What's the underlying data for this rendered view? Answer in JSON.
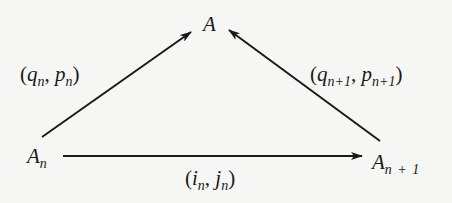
{
  "diagram": {
    "type": "commutative-triangle",
    "nodes": {
      "top": {
        "base": "A",
        "sub": ""
      },
      "left": {
        "base": "A",
        "sub": "n"
      },
      "right": {
        "base": "A",
        "sub": "n + 1"
      }
    },
    "edges": {
      "left_to_top": {
        "open": "(",
        "a": "q",
        "a_sub": "n",
        "sep": ", ",
        "b": "p",
        "b_sub": "n",
        "close": ")"
      },
      "right_to_top": {
        "open": "(",
        "a": "q",
        "a_sub": "n+1",
        "sep": ", ",
        "b": "p",
        "b_sub": "n+1",
        "close": ")"
      },
      "left_to_right": {
        "open": "(",
        "a": "i",
        "a_sub": "n",
        "sep": ", ",
        "b": "j",
        "b_sub": "n",
        "close": ")"
      }
    },
    "colors": {
      "background": "#f6f6f4",
      "ink": "#1a1a1a"
    }
  }
}
